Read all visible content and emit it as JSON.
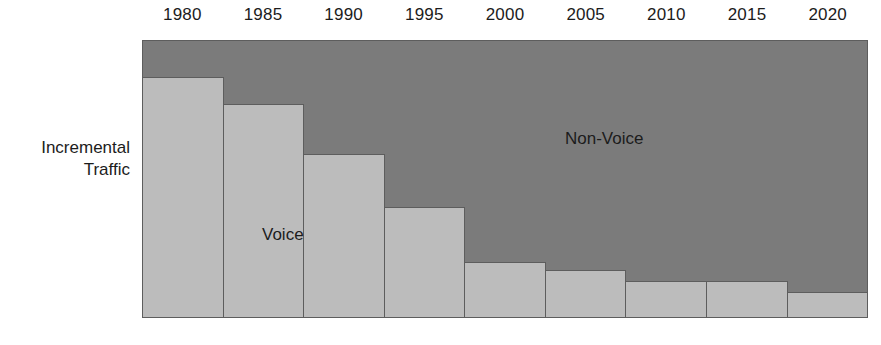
{
  "axis_title": {
    "line1": "Incremental",
    "line2": "Traffic"
  },
  "series_labels": {
    "voice": "Voice",
    "non_voice": "Non-Voice"
  },
  "colors": {
    "non_voice_fill": "#7b7b7b",
    "voice_fill": "#bcbcbc",
    "outline": "#5d5d5d",
    "text": "#1c1c1c",
    "background": "#ffffff"
  },
  "chart_data": {
    "type": "bar",
    "title": "",
    "subtitle": "",
    "xlabel": "",
    "ylabel": "Incremental Traffic",
    "ylim": [
      0,
      100
    ],
    "grid": false,
    "legend_position": "in-plot",
    "categories": [
      "1980",
      "1985",
      "1990",
      "1995",
      "2000",
      "2005",
      "2010",
      "2015",
      "2020"
    ],
    "series": [
      {
        "name": "Voice",
        "values": [
          87,
          77,
          59,
          40,
          20,
          17,
          13,
          13,
          9
        ]
      },
      {
        "name": "Non-Voice",
        "values": [
          13,
          23,
          41,
          60,
          80,
          83,
          87,
          87,
          91
        ]
      }
    ],
    "annotations": [
      {
        "text": "Voice",
        "x": "1985",
        "y": 30
      },
      {
        "text": "Non-Voice",
        "x": "2005",
        "y": 72
      }
    ]
  }
}
